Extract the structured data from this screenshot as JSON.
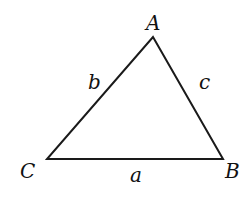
{
  "diagram": {
    "type": "triangle",
    "stroke_color": "#1a1a1a",
    "vertices": [
      {
        "label": "A",
        "x": 153,
        "y": 37
      },
      {
        "label": "B",
        "x": 223,
        "y": 159
      },
      {
        "label": "C",
        "x": 47,
        "y": 159
      }
    ],
    "sides": [
      {
        "label": "a",
        "between": "C-B"
      },
      {
        "label": "b",
        "between": "C-A"
      },
      {
        "label": "c",
        "between": "A-B"
      }
    ]
  }
}
